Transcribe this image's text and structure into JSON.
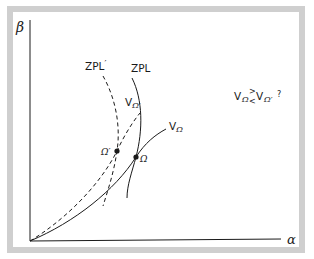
{
  "colors": {
    "frame": "#cfcfcf",
    "background": "#ffffff",
    "ink": "#1a1a1a"
  },
  "axes": {
    "y_label": "β",
    "x_label": "α"
  },
  "curves": {
    "zpl_prime": {
      "label": "ZPL",
      "prime": "′",
      "style": "dashed"
    },
    "zpl": {
      "label": "ZPL",
      "style": "solid"
    },
    "v_omega_prime": {
      "label": "V",
      "sub": "Ω′",
      "style": "dashed"
    },
    "v_omega": {
      "label": "V",
      "sub": "Ω",
      "style": "solid"
    }
  },
  "points": {
    "omega_prime": {
      "label": "Ω′"
    },
    "omega": {
      "label": "Ω"
    }
  },
  "question": {
    "v1": "V",
    "sub1": "Ω",
    "gt": ">",
    "lt": "<",
    "v2": "V",
    "sub2": "Ω′",
    "mark": "?"
  }
}
